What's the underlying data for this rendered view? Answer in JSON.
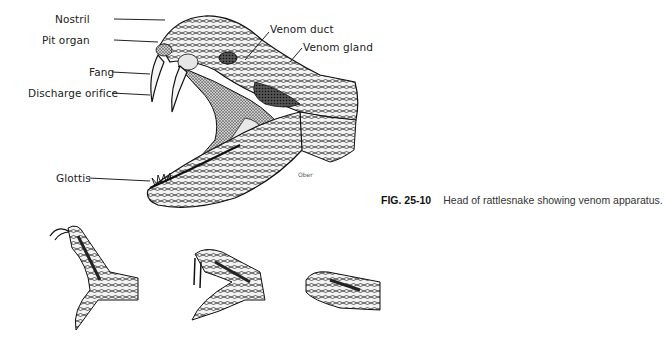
{
  "figure": {
    "number": "FIG. 25-10",
    "caption": "Head of rattlesnake showing venom apparatus.",
    "artist_signature": "Ober"
  },
  "labels": {
    "nostril": "Nostril",
    "pit_organ": "Pit organ",
    "fang": "Fang",
    "discharge_orifice": "Discharge orifice",
    "glottis": "Glottis",
    "venom_duct": "Venom duct",
    "venom_gland": "Venom gland"
  },
  "thumbnails": [
    {
      "view": "head raised, mouth open front view"
    },
    {
      "view": "mouth open striking pose, side view"
    },
    {
      "view": "mouth closed, side view"
    }
  ],
  "colors": {
    "ink": "#1a1a1a",
    "paper": "#ffffff"
  }
}
